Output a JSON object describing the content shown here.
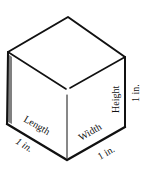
{
  "diagram": {
    "labels": {
      "length": "Length",
      "width": "Width",
      "height": "Height",
      "length_measure": "1 in.",
      "width_measure": "1 in.",
      "height_measure": "1 in."
    },
    "colors": {
      "stroke": "#111111",
      "background": "#ffffff",
      "shade": "#444444"
    }
  }
}
